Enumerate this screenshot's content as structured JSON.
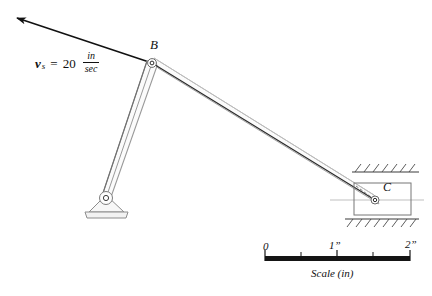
{
  "figure": {
    "type": "kinematics-mechanism-diagram"
  },
  "labels": {
    "point_B": "B",
    "point_C": "C",
    "velocity": {
      "symbol": "v",
      "subscript": "s",
      "equals": "=",
      "magnitude": "20",
      "unit_numerator": "in",
      "unit_denominator": "sec"
    }
  },
  "scale": {
    "caption": "Scale (in)",
    "ticks": [
      {
        "label": "0",
        "value": 0
      },
      {
        "label": "",
        "value": 0.5
      },
      {
        "label": "1”",
        "value": 1
      },
      {
        "label": "",
        "value": 1.5
      },
      {
        "label": "2”",
        "value": 2
      }
    ]
  },
  "geometry": {
    "pivot_O": {
      "x": 106,
      "y": 198
    },
    "joint_B": {
      "x": 152,
      "y": 63
    },
    "slider_C": {
      "x": 375,
      "y": 200
    },
    "velocity_arrow_tip": {
      "x": 12,
      "y": 14
    },
    "slider_block": {
      "x": 354,
      "y": 183,
      "width": 57,
      "height": 32
    },
    "guide_top_y": 172,
    "guide_bottom_y": 219,
    "scale_bar": {
      "x": 265,
      "y": 256,
      "width": 145,
      "height": 5
    }
  },
  "colors": {
    "ink": "#111111",
    "bar_outline": "#9a9a9a",
    "bar_fill": "#fbfbfb",
    "center_line": "#b8b8b8",
    "hatch": "#555555"
  }
}
